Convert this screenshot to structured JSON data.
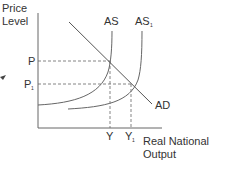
{
  "diagram": {
    "y_axis_label_line1": "Price",
    "y_axis_label_line2": "Level",
    "x_axis_label_line1": "Real National",
    "x_axis_label_line2": "Output",
    "curves": {
      "as": "AS",
      "as1_base": "AS",
      "as1_sub": "1",
      "ad": "AD"
    },
    "price_ticks": {
      "p": "P",
      "p1_base": "P",
      "p1_sub": "1"
    },
    "output_ticks": {
      "y": "Y",
      "y1_base": "Y",
      "y1_sub": "1"
    },
    "colors": {
      "line": "#555555",
      "text": "#333333",
      "background": "#ffffff"
    }
  }
}
